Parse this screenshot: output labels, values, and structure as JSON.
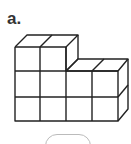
{
  "problem": {
    "label": "a.",
    "figure": {
      "type": "cube-stack",
      "description": "3D stack of unit cubes",
      "front_columns": 4,
      "column_heights": [
        3,
        3,
        2,
        2
      ],
      "stroke_color": "#222222"
    },
    "answer_box": {
      "value": ""
    }
  }
}
